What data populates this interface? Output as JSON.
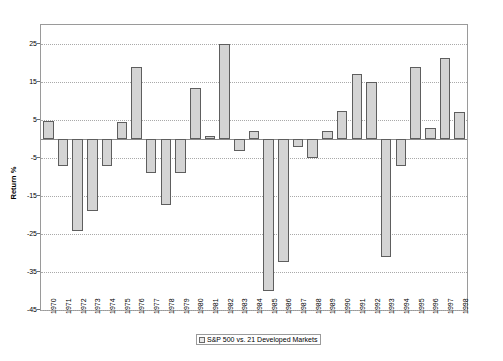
{
  "chart_data": {
    "type": "bar",
    "title": "",
    "xlabel": "",
    "ylabel": "Return %",
    "ylim": [
      -45,
      30
    ],
    "yticks": [
      25,
      15,
      5,
      -5,
      -15,
      -25,
      -35,
      -45
    ],
    "grid": true,
    "legend_position": "bottom",
    "legend": [
      "S&P 500 vs. 21 Developed Markets"
    ],
    "categories": [
      "1970",
      "1971",
      "1972",
      "1973",
      "1974",
      "1975",
      "1976",
      "1977",
      "1978",
      "1979",
      "1980",
      "1981",
      "1982",
      "1983",
      "1984",
      "1985",
      "1986",
      "1987",
      "1988",
      "1989",
      "1990",
      "1991",
      "1992",
      "1993",
      "1994",
      "1995",
      "1996",
      "1997",
      "1998"
    ],
    "series": [
      {
        "name": "S&P 500 vs. 21 Developed Markets",
        "values": [
          4.8,
          -7.2,
          -24.2,
          -19.0,
          -7.2,
          4.5,
          19.0,
          -9.0,
          -17.3,
          -9.0,
          13.5,
          0.8,
          25.0,
          -3.2,
          2.0,
          -40.0,
          -32.3,
          -2.2,
          -5.0,
          2.2,
          7.3,
          17.2,
          15.0,
          -31.0,
          -7.0,
          19.0,
          3.0,
          21.3,
          7.0
        ]
      }
    ]
  },
  "axis": {
    "y_title": "Return %"
  },
  "legend": {
    "entries": [
      {
        "label": "S&P 500 vs. 21 Developed Markets",
        "swatch_color": "#e8e8e8"
      }
    ]
  },
  "colors": {
    "bar_fill": "#d4d4d4",
    "bar_border": "#5e5e5e",
    "gridline": "#a9a9a9",
    "frame": "#9a9a9a",
    "background": "#ffffff"
  }
}
